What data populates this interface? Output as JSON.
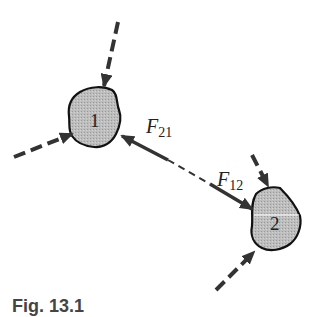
{
  "diagram": {
    "bodies": [
      {
        "id": "1",
        "label": "1"
      },
      {
        "id": "2",
        "label": "2"
      }
    ],
    "forces": [
      {
        "name": "F",
        "subscript": "21",
        "description": "force on body 1 due to body 2"
      },
      {
        "name": "F",
        "subscript": "12",
        "description": "force on body 2 due to body 1"
      }
    ],
    "external_forces": 4,
    "colors": {
      "body_fill": "#b8b8b8",
      "outline": "#111111",
      "arrow": "#333333"
    }
  },
  "caption": {
    "text": "Fig. 13.1"
  }
}
